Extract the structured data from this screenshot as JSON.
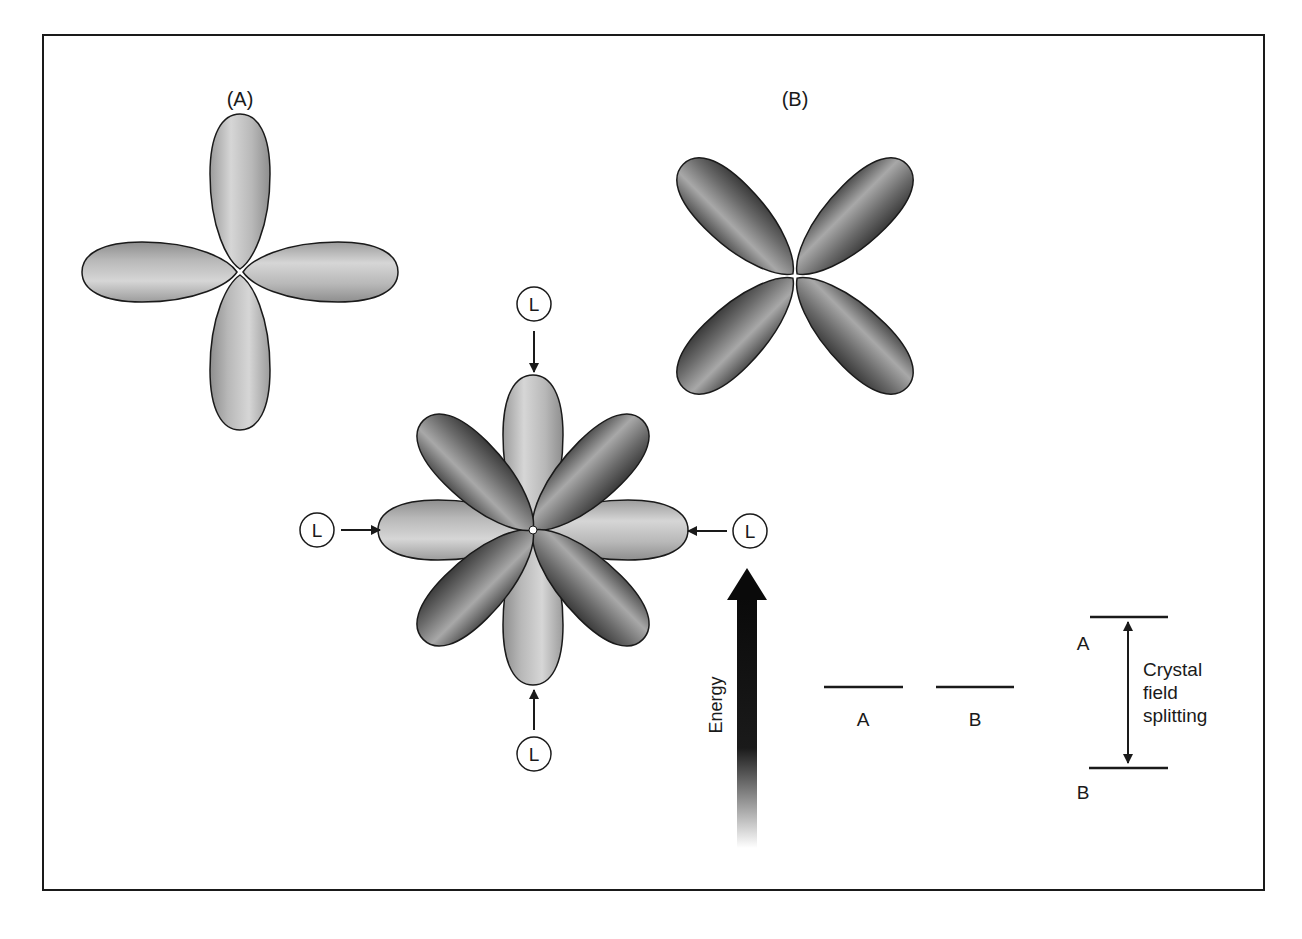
{
  "figure": {
    "panel_labels": {
      "a": "(A)",
      "b": "(B)"
    },
    "ligand_label": "L",
    "energy_label": "Energy",
    "degenerate_levels": [
      {
        "label": "A"
      },
      {
        "label": "B"
      }
    ],
    "split_levels": {
      "upper": "A",
      "lower": "B"
    },
    "splitting_label": [
      "Crystal",
      "field",
      "splitting"
    ],
    "colors": {
      "orbital_a_light": "#dcdcdc",
      "orbital_a_dark": "#9a9a9a",
      "orbital_b_light": "#b4b4b4",
      "orbital_b_dark": "#4a4a4a",
      "outline": "#1a1a1a",
      "frame": "#1a1a1a"
    }
  }
}
